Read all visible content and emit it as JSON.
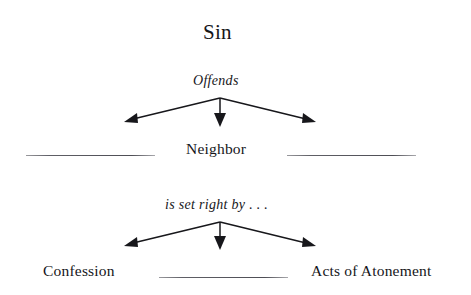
{
  "diagram": {
    "type": "concept-flow-diagram",
    "background_color": "#ffffff",
    "text_color": "#16161a",
    "line_color": "#17171b",
    "blank_line_color": "#5f5f66",
    "title": "Sin",
    "levels": [
      {
        "edge_label": "Offends",
        "nodes": [
          {
            "label": "",
            "kind": "blank-line"
          },
          {
            "label": "Neighbor",
            "kind": "text"
          },
          {
            "label": "",
            "kind": "blank-line"
          }
        ]
      },
      {
        "edge_label": "is set right by . . .",
        "nodes": [
          {
            "label": "Confession",
            "kind": "text"
          },
          {
            "label": "",
            "kind": "blank-line"
          },
          {
            "label": "Acts of Atonement",
            "kind": "text"
          }
        ]
      }
    ]
  }
}
